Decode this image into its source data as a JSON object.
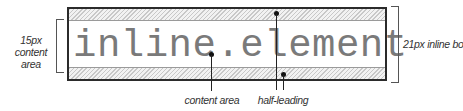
{
  "diagram": {
    "sample_text": "inline.element",
    "labels": {
      "content_area_size": "15px content area",
      "content_area_size_line1": "15px content",
      "content_area_size_line2": "area",
      "inline_box_size": "21px inline box",
      "content_area": "content area",
      "half_leading": "half-leading"
    },
    "colors": {
      "border": "#2b2b2b",
      "text": "#7a7a7a",
      "hatch": "#c8c8c8"
    }
  }
}
